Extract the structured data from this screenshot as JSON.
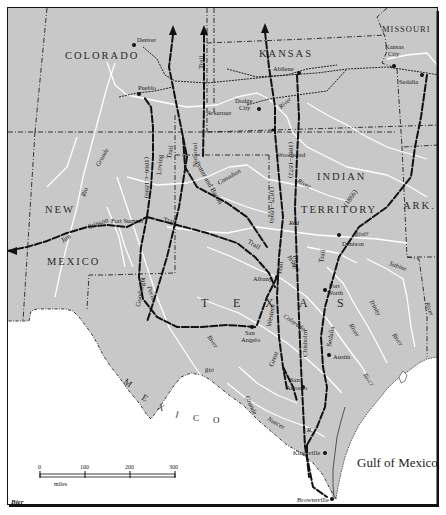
{
  "map": {
    "title": "Cattle Trails of Texas",
    "colors": {
      "land": "#c8c8c8",
      "water": "#ffffff",
      "river": "#ffffff",
      "trail": "#111111",
      "border": "#222222",
      "frame": "#111111"
    },
    "states": {
      "colorado": "COLORADO",
      "kansas": "KANSAS",
      "missouri": "MISSOURI",
      "new": "NEW",
      "mexico_nm": "MEXICO",
      "indian": "INDIAN",
      "territory": "TERRITORY",
      "ark": "ARK.",
      "texas_t": "T",
      "texas_e": "E",
      "texas_x": "X",
      "texas_a": "A",
      "texas_s": "S",
      "mexico_m": "M",
      "mexico_e": "E",
      "mexico_x": "X",
      "mexico_i": "I",
      "mexico_c": "C",
      "mexico_o": "O"
    },
    "cities": {
      "denver": "Denver",
      "pueblo": "Pueblo",
      "abilene": "Abilene",
      "kansas_city_1": "Kansas",
      "kansas_city_2": "City",
      "sedalia_mo": "Sedalia",
      "dodge_city_1": "Dodge",
      "dodge_city_2": "City",
      "woodward": "Woodward",
      "fort_sumner": "Fort Sumner",
      "denison": "Denison",
      "albany": "Albany",
      "fort_worth_1": "Fort",
      "fort_worth_2": "Worth",
      "san_angelo_1": "San",
      "san_angelo_2": "Angelo",
      "austin": "Austin",
      "san_antonio_1": "San",
      "san_antonio_2": "Antonio",
      "kingsville": "Kingsville",
      "brownsville": "Brownsville"
    },
    "rivers": {
      "arkansas": "Arkansas",
      "arkansas_river": "River",
      "rio": "Rio",
      "grande": "Grande",
      "canadian": "Canadian",
      "red": "Red",
      "red_river": "River",
      "indian_river": "River",
      "brazos": "Brazos",
      "colorado": "Colorado",
      "pecos": "Pecos",
      "pecos_river": "River",
      "rio_lower": "Rio",
      "grande_lower": "Grande",
      "nueces": "Nueces",
      "nueces_r": "R.",
      "trinity": "Trinity",
      "sabine": "Sabine",
      "sabine_river": "River",
      "trinity_river": "River",
      "brazos_river": "River",
      "colorado_river": "River",
      "big_river_tx": "River"
    },
    "trails": {
      "jim": "Jim",
      "stinson": "Stinson",
      "trail_fs": "Trail",
      "goodnight": "Goodnight",
      "loving": "Loving",
      "loving_trail": "Trail",
      "goodnight_dates": "(1866–c.1890)",
      "national": "National",
      "national_trail": "Trail",
      "potter_bacon": "Potter and Bacon",
      "potter_trail": "Trail",
      "western_dates": "(1875–1890)",
      "western": "Western",
      "western_trail": "Trail",
      "great": "Great",
      "chisholm_dates": "(1867–1872)",
      "chisholm": "Chisholm",
      "chisholm_trail": "Trail",
      "sedalia_dates": "(1866)",
      "sedalia": "Sedalia",
      "sedalia_trail": "Trail"
    },
    "water": {
      "gulf": "Gulf of Mexico"
    },
    "scale": {
      "ticks": [
        "0",
        "100",
        "200",
        "300"
      ],
      "unit": "miles"
    },
    "credit": "Bier"
  }
}
